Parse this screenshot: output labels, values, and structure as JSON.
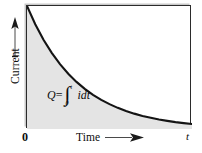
{
  "figure": {
    "name": "current-vs-time-discharge-curve"
  },
  "axes": {
    "y": {
      "label": "Current",
      "arrow_icon": "arrow-up-icon"
    },
    "x": {
      "label": "Time",
      "arrow_icon": "arrow-right-icon",
      "origin_label": "0",
      "end_label": "t"
    }
  },
  "formula": {
    "left": "Q",
    "equals": "=",
    "integral_glyph": "∫",
    "upper_limit": "t",
    "lower_limit": "0",
    "integrand": "idt"
  },
  "colors": {
    "curve": "#141414",
    "shaded_area": "#e4e4e4",
    "frame": "#2b2b2b",
    "frame_shadow": "#c9c9c9",
    "background": "#ffffff",
    "text": "#0d0d0d"
  },
  "chart_data": {
    "type": "line",
    "title": "",
    "xlabel": "Time",
    "ylabel": "Current",
    "xlim": [
      0,
      1
    ],
    "ylim": [
      0,
      1
    ],
    "grid": false,
    "legend": null,
    "xticks": [
      "0",
      "t"
    ],
    "yticks": [],
    "fill_under_curve": true,
    "annotations": [
      "Q = ∫₀ᵗ i dt"
    ],
    "series": [
      {
        "name": "Discharge current i(t)",
        "x": [
          0.0,
          0.05,
          0.1,
          0.15,
          0.2,
          0.25,
          0.3,
          0.35,
          0.4,
          0.45,
          0.5,
          0.55,
          0.6,
          0.65,
          0.7,
          0.75,
          0.8,
          0.85,
          0.9,
          0.95,
          1.0
        ],
        "y": [
          1.0,
          0.852,
          0.726,
          0.619,
          0.527,
          0.449,
          0.383,
          0.326,
          0.278,
          0.237,
          0.202,
          0.172,
          0.146,
          0.125,
          0.106,
          0.091,
          0.077,
          0.066,
          0.056,
          0.048,
          0.041
        ]
      }
    ]
  }
}
